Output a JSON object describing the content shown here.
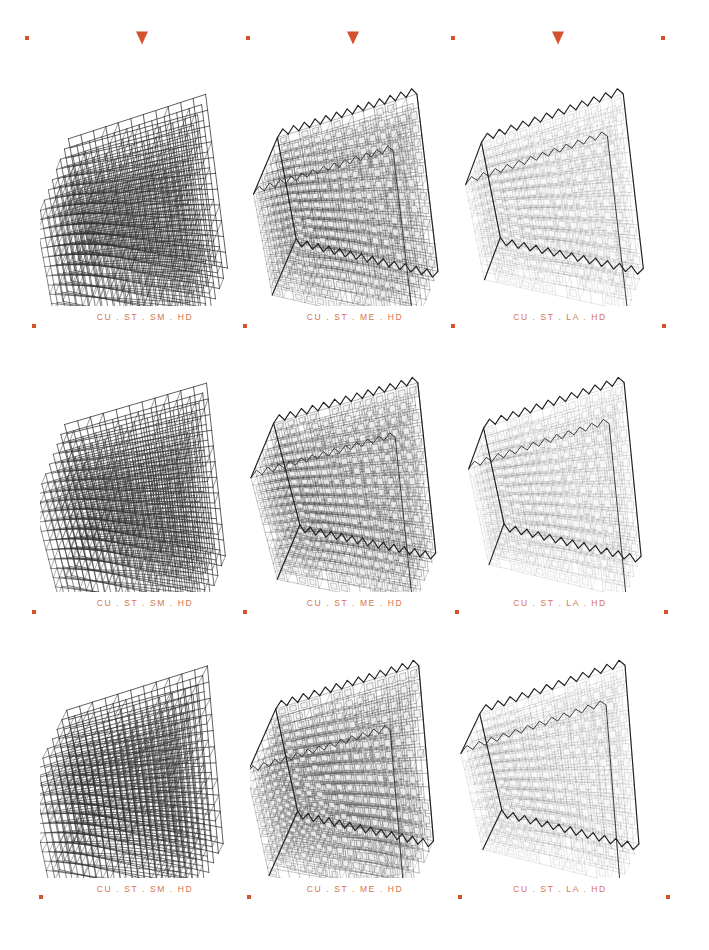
{
  "page": {
    "background": "#ffffff",
    "accent_color": "#d4532c",
    "caption_color": "#d4744f",
    "ink_color": "#2a2a2a"
  },
  "markers": {
    "dot_name": "square-dot-marker",
    "triangle_name": "down-triangle-marker",
    "rows": [
      {
        "y": 38,
        "items": [
          {
            "type": "dot",
            "x": 27
          },
          {
            "type": "triangle",
            "x": 142
          },
          {
            "type": "dot",
            "x": 248
          },
          {
            "type": "triangle",
            "x": 353
          },
          {
            "type": "dot",
            "x": 453
          },
          {
            "type": "triangle",
            "x": 558
          },
          {
            "type": "dot",
            "x": 663
          }
        ]
      },
      {
        "y": 326,
        "items": [
          {
            "type": "dot",
            "x": 34
          },
          {
            "type": "dot",
            "x": 245
          },
          {
            "type": "dot",
            "x": 453
          },
          {
            "type": "dot",
            "x": 664
          }
        ]
      },
      {
        "y": 612,
        "items": [
          {
            "type": "dot",
            "x": 34
          },
          {
            "type": "dot",
            "x": 245
          },
          {
            "type": "dot",
            "x": 457
          },
          {
            "type": "dot",
            "x": 666
          }
        ]
      },
      {
        "y": 897,
        "items": [
          {
            "type": "dot",
            "x": 41
          },
          {
            "type": "dot",
            "x": 249
          },
          {
            "type": "dot",
            "x": 460
          },
          {
            "type": "dot",
            "x": 668
          }
        ]
      }
    ]
  },
  "gallery": {
    "columns": 3,
    "rows": 3,
    "cells": [
      {
        "id": "r1c1",
        "x": 40,
        "y": 78,
        "label": "CU . ST . SM . HD",
        "variant": "small",
        "seed": 11
      },
      {
        "id": "r1c2",
        "x": 250,
        "y": 78,
        "label": "CU . ST . ME . HD",
        "variant": "medium",
        "seed": 12
      },
      {
        "id": "r1c3",
        "x": 455,
        "y": 78,
        "label": "CU . ST . LA . HD",
        "variant": "large",
        "seed": 13
      },
      {
        "id": "r2c1",
        "x": 40,
        "y": 364,
        "label": "CU . ST . SM . HD",
        "variant": "small",
        "seed": 21
      },
      {
        "id": "r2c2",
        "x": 250,
        "y": 364,
        "label": "CU . ST . ME . HD",
        "variant": "medium",
        "seed": 22
      },
      {
        "id": "r2c3",
        "x": 455,
        "y": 364,
        "label": "CU . ST . LA . HD",
        "variant": "large",
        "seed": 23
      },
      {
        "id": "r3c1",
        "x": 40,
        "y": 650,
        "label": "CU . ST . SM . HD",
        "variant": "small",
        "seed": 31
      },
      {
        "id": "r3c2",
        "x": 250,
        "y": 650,
        "label": "CU . ST . ME . HD",
        "variant": "medium",
        "seed": 32
      },
      {
        "id": "r3c3",
        "x": 455,
        "y": 650,
        "label": "CU . ST . LA . HD",
        "variant": "large",
        "seed": 33
      }
    ]
  },
  "variants": {
    "small": {
      "name": "dense-wire-lattice",
      "divisions": 11,
      "stroke": "#333333",
      "stroke_width": 0.85,
      "fill": "none",
      "opacity": 0.92,
      "layers": 9,
      "serrated": false
    },
    "medium": {
      "name": "shaded-grid-lattice",
      "divisions": 13,
      "stroke": "#555555",
      "stroke_width": 0.55,
      "fill": "#f2f2f2",
      "opacity": 0.8,
      "layers": 7,
      "serrated": true
    },
    "large": {
      "name": "sparse-diamond-shell",
      "divisions": 12,
      "stroke": "#888888",
      "stroke_width": 0.45,
      "fill": "#fafafa",
      "opacity": 0.6,
      "layers": 5,
      "serrated": true
    }
  }
}
